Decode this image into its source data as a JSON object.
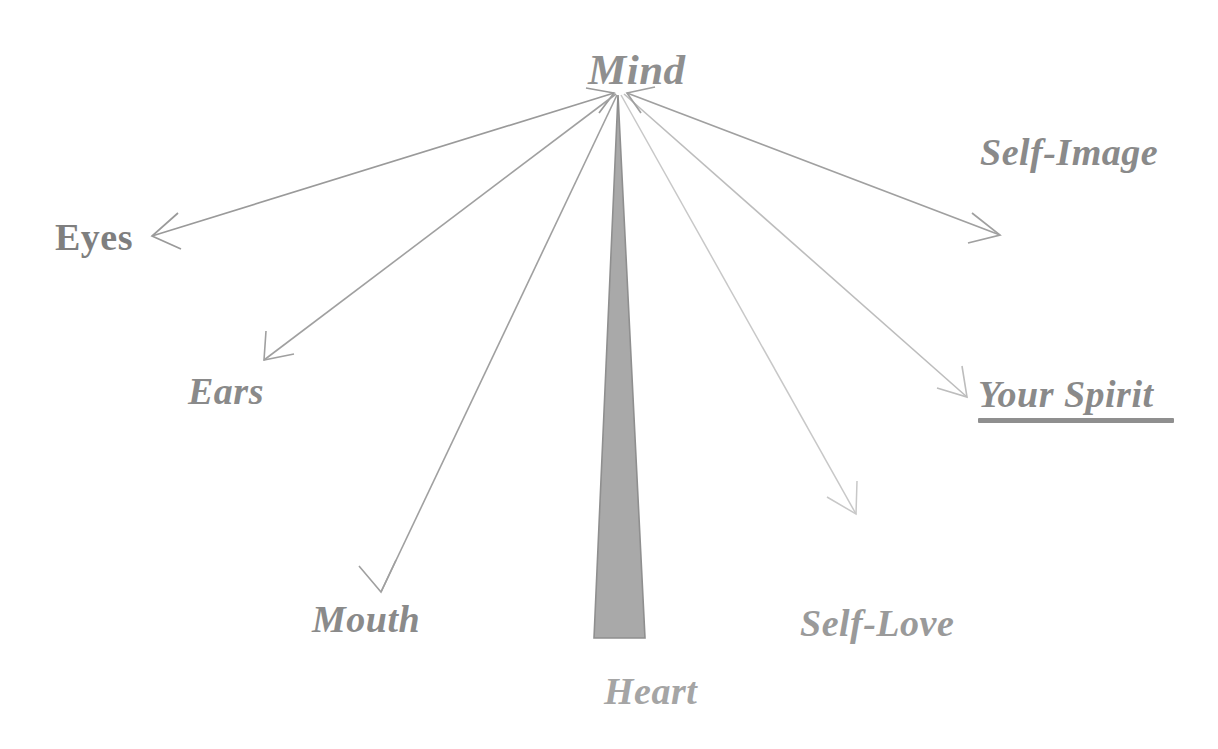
{
  "diagram": {
    "type": "radial-fan-diagram",
    "title_node": "Mind",
    "background_color": "#ffffff",
    "palette": {
      "dark_gray": "#8a8a8a",
      "mid_gray": "#9a9a9a",
      "light_gray": "#b8b8b8",
      "very_light_gray": "#cccccc",
      "triangle_fill": "#a9a9a9",
      "triangle_stroke": "#8f8f8f"
    },
    "center": {
      "label": "Mind",
      "x": 618,
      "y": 70,
      "font_size": 43,
      "style": "bold-italic",
      "color": "#8f8f8f"
    },
    "nodes": [
      {
        "id": "eyes",
        "label": "Eyes",
        "x": 55,
        "y": 218,
        "font_size": 38,
        "style": "bold-upright",
        "color": "#7f7f7f",
        "arrow": {
          "from_x": 614,
          "from_y": 93,
          "to_x": 152,
          "to_y": 236,
          "color": "#9a9a9a",
          "width": 1.6,
          "head": "both"
        }
      },
      {
        "id": "ears",
        "label": "Ears",
        "x": 188,
        "y": 372,
        "font_size": 38,
        "style": "bold-italic",
        "color": "#8a8a8a",
        "arrow": {
          "from_x": 616,
          "from_y": 94,
          "to_x": 264,
          "to_y": 360,
          "color": "#a0a0a0",
          "width": 1.5,
          "head": "end"
        }
      },
      {
        "id": "mouth",
        "label": "Mouth",
        "x": 312,
        "y": 600,
        "font_size": 38,
        "style": "bold-italic",
        "color": "#8a8a8a",
        "arrow": {
          "from_x": 617,
          "from_y": 95,
          "to_x": 381,
          "to_y": 592,
          "color": "#a0a0a0",
          "width": 1.5,
          "head": "end"
        }
      },
      {
        "id": "heart",
        "label": "Heart",
        "x": 604,
        "y": 672,
        "font_size": 38,
        "style": "bold-italic",
        "color": "#a5a5a5",
        "shape": {
          "kind": "triangle",
          "apex_x": 618,
          "apex_y": 95,
          "base_left_x": 594,
          "base_right_x": 645,
          "base_y": 638,
          "fill": "#a9a9a9",
          "stroke": "#8f8f8f"
        }
      },
      {
        "id": "self-love",
        "label": "Self-Love",
        "x": 800,
        "y": 604,
        "font_size": 38,
        "style": "bold-italic",
        "color": "#9a9a9a",
        "arrow": {
          "from_x": 621,
          "from_y": 95,
          "to_x": 856,
          "to_y": 514,
          "color": "#c8c8c8",
          "width": 1.4,
          "head": "end"
        }
      },
      {
        "id": "your-spirit",
        "label": "Your Spirit",
        "x": 978,
        "y": 375,
        "font_size": 38,
        "style": "bold-italic-underline",
        "color": "#8a8a8a",
        "underline": {
          "x": 978,
          "y": 418,
          "width": 196,
          "height": 5,
          "color": "#8f8f8f"
        },
        "arrow": {
          "from_x": 624,
          "from_y": 94,
          "to_x": 967,
          "to_y": 397,
          "color": "#bdbdbd",
          "width": 1.5,
          "head": "end"
        }
      },
      {
        "id": "self-image",
        "label": "Self-Image",
        "x": 980,
        "y": 133,
        "font_size": 38,
        "style": "bold-italic",
        "color": "#8a8a8a",
        "arrow": {
          "from_x": 627,
          "from_y": 93,
          "to_x": 1000,
          "to_y": 235,
          "color": "#a0a0a0",
          "width": 1.6,
          "head": "both"
        }
      }
    ]
  }
}
